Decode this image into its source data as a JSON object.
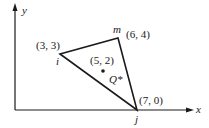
{
  "diagram": {
    "axes": {
      "x_label": "x",
      "y_label": "y"
    },
    "nodes": {
      "i": {
        "name": "i",
        "coord_label": "(3, 3)"
      },
      "m": {
        "name": "m",
        "coord_label": "(6, 4)"
      },
      "j": {
        "name": "j",
        "coord_label": "(7, 0)"
      }
    },
    "interior_point": {
      "coord_label": "(5, 2)",
      "name": "Q*"
    },
    "colors": {
      "stroke": "#1a1a1a",
      "background": "#ffffff"
    }
  }
}
